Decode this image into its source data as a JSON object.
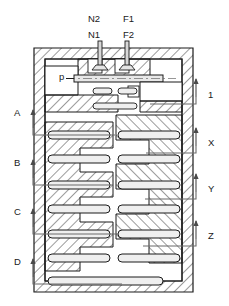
{
  "figure": {
    "kind": "patent-cross-section",
    "line_color": "#1b1b1b",
    "hatch_color": "#3a3a3a",
    "slot_fill": "#efefef",
    "leader_color": "#6a6a6a",
    "background": "#ffffff"
  },
  "top_labels": [
    {
      "id": "N2",
      "text": "N2",
      "x": 88,
      "y": 14
    },
    {
      "id": "F1",
      "text": "F1",
      "x": 123,
      "y": 14
    },
    {
      "id": "N1",
      "text": "N1",
      "x": 88,
      "y": 30
    },
    {
      "id": "F2",
      "text": "F2",
      "x": 123,
      "y": 30
    }
  ],
  "inner_labels": [
    {
      "id": "p",
      "text": "p",
      "x": 59,
      "y": 76
    }
  ],
  "left_callouts": [
    {
      "id": "A",
      "text": "A",
      "label_x": 14,
      "label_y": 113,
      "arrow_x": 33,
      "arrow_top": 110,
      "arrow_bottom": 128,
      "leader_y": 135,
      "leader_to_x": 115
    },
    {
      "id": "B",
      "text": "B",
      "label_x": 14,
      "label_y": 163,
      "arrow_x": 33,
      "arrow_top": 160,
      "arrow_bottom": 178,
      "leader_y": 185,
      "leader_to_x": 112
    },
    {
      "id": "C",
      "text": "C",
      "label_x": 14,
      "label_y": 212,
      "arrow_x": 33,
      "arrow_top": 209,
      "arrow_bottom": 227,
      "leader_y": 234,
      "leader_to_x": 118
    },
    {
      "id": "D",
      "text": "D",
      "label_x": 14,
      "label_y": 262,
      "arrow_x": 33,
      "arrow_top": 259,
      "arrow_bottom": 277,
      "leader_y": 284,
      "leader_to_x": 122
    }
  ],
  "right_callouts": [
    {
      "id": "1",
      "text": "1",
      "label_x": 208,
      "label_y": 95,
      "arrow_x": 196,
      "arrow_top": 79,
      "arrow_bottom": 97,
      "leader_y": 104,
      "leader_to_x": 150
    },
    {
      "id": "X",
      "text": "X",
      "label_x": 208,
      "label_y": 143,
      "arrow_x": 196,
      "arrow_top": 128,
      "arrow_bottom": 146,
      "leader_y": 153,
      "leader_to_x": 146
    },
    {
      "id": "Y",
      "text": "Y",
      "label_x": 208,
      "label_y": 189,
      "arrow_x": 196,
      "arrow_top": 174,
      "arrow_bottom": 192,
      "leader_y": 199,
      "leader_to_x": 145
    },
    {
      "id": "Z",
      "text": "Z",
      "label_x": 208,
      "label_y": 236,
      "arrow_x": 196,
      "arrow_top": 221,
      "arrow_bottom": 239,
      "leader_y": 246,
      "leader_to_x": 143
    }
  ],
  "body": {
    "x": 34,
    "y": 48,
    "width": 159,
    "height": 244,
    "wall": 11
  },
  "stems": [
    {
      "id": "stem-left",
      "cx": 100,
      "top": 41,
      "stem_w": 4,
      "head_y": 70,
      "head_w": 16
    },
    {
      "id": "stem-right",
      "cx": 127,
      "top": 41,
      "stem_w": 4,
      "head_y": 70,
      "head_w": 16
    }
  ],
  "shaft": {
    "x1": 74,
    "x2": 163,
    "y": 79,
    "height": 7
  },
  "left_slots": [
    {
      "x": 48,
      "y": 131,
      "w": 62,
      "h": 8
    },
    {
      "x": 48,
      "y": 155,
      "w": 62,
      "h": 8
    },
    {
      "x": 48,
      "y": 181,
      "w": 62,
      "h": 8
    },
    {
      "x": 48,
      "y": 205,
      "w": 62,
      "h": 8
    },
    {
      "x": 48,
      "y": 230,
      "w": 62,
      "h": 8
    },
    {
      "x": 48,
      "y": 254,
      "w": 62,
      "h": 8
    },
    {
      "x": 48,
      "y": 277,
      "w": 115,
      "h": 8
    }
  ],
  "right_slots": [
    {
      "x": 118,
      "y": 131,
      "w": 62,
      "h": 8
    },
    {
      "x": 118,
      "y": 155,
      "w": 62,
      "h": 8
    },
    {
      "x": 118,
      "y": 181,
      "w": 62,
      "h": 8
    },
    {
      "x": 118,
      "y": 205,
      "w": 62,
      "h": 8
    },
    {
      "x": 118,
      "y": 230,
      "w": 62,
      "h": 8
    },
    {
      "x": 118,
      "y": 254,
      "w": 62,
      "h": 8
    }
  ],
  "upper_slots": [
    {
      "x": 93,
      "y": 88,
      "w": 19,
      "h": 6
    },
    {
      "x": 118,
      "y": 88,
      "w": 19,
      "h": 6
    },
    {
      "x": 93,
      "y": 103,
      "w": 44,
      "h": 6
    }
  ]
}
